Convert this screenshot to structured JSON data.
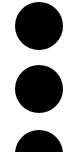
{
  "icon": {
    "name": "more-vertical-icon",
    "label": "More options",
    "dot_count": 3,
    "color": "#000000",
    "background": "#ffffff"
  }
}
